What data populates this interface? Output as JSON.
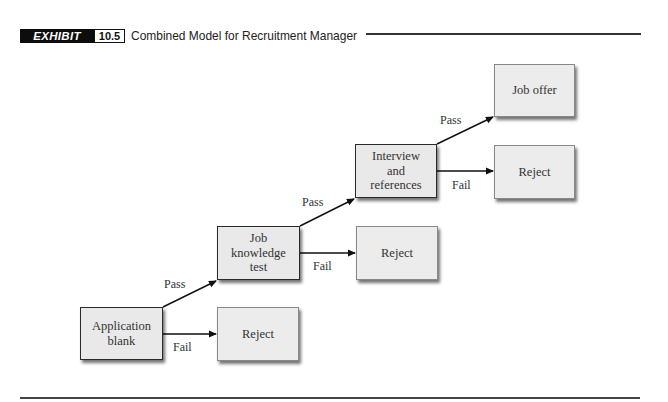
{
  "header": {
    "exhibit_label": "EXHIBIT",
    "exhibit_number": "10.5",
    "title": "Combined Model for Recruitment Manager"
  },
  "diagram": {
    "stages": [
      {
        "id": "application",
        "label_lines": [
          "Application",
          "blank"
        ]
      },
      {
        "id": "job-knowledge",
        "label_lines": [
          "Job",
          "knowledge",
          "test"
        ]
      },
      {
        "id": "interview",
        "label_lines": [
          "Interview",
          "and",
          "references"
        ]
      }
    ],
    "outcomes": [
      {
        "id": "reject-1",
        "label": "Reject"
      },
      {
        "id": "reject-2",
        "label": "Reject"
      },
      {
        "id": "reject-3",
        "label": "Reject"
      },
      {
        "id": "job-offer",
        "label": "Job offer"
      }
    ],
    "edges": [
      {
        "from": "application",
        "to": "job-knowledge",
        "label": "Pass"
      },
      {
        "from": "application",
        "to": "reject-1",
        "label": "Fail"
      },
      {
        "from": "job-knowledge",
        "to": "interview",
        "label": "Pass"
      },
      {
        "from": "job-knowledge",
        "to": "reject-2",
        "label": "Fail"
      },
      {
        "from": "interview",
        "to": "job-offer",
        "label": "Pass"
      },
      {
        "from": "interview",
        "to": "reject-3",
        "label": "Fail"
      }
    ]
  },
  "colors": {
    "box_fill": "#e9e9e9",
    "stage_border": "#2a2a2a",
    "outcome_border": "#888888",
    "label_bg": "#0d0d0d"
  }
}
